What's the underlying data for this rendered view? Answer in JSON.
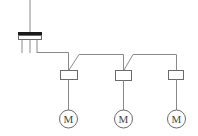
{
  "diagram": {
    "title": "",
    "colors": {
      "background": "#ffffff",
      "wire": "#8a8a8a",
      "outline": "#6a6a6a",
      "busbar": "#1a1a1a",
      "text": "#444444"
    },
    "supply": {
      "label": "power-supply-switch",
      "feed_x": 30,
      "bar": {
        "x": 18,
        "y": 32,
        "width": 24,
        "black_height": 3,
        "white_height": 4
      },
      "legs_x": [
        22,
        30,
        37
      ],
      "legs_bottom_y": 53
    },
    "branches": [
      {
        "id": "branch-1",
        "contactor": {
          "x": 60,
          "y": 70,
          "width": 17,
          "height": 9
        },
        "center_x": 68,
        "motor": {
          "cx": 68,
          "cy": 119,
          "r": 9,
          "label": "M"
        }
      },
      {
        "id": "branch-2",
        "contactor": {
          "x": 115,
          "y": 70,
          "width": 16,
          "height": 10
        },
        "center_x": 123,
        "motor": {
          "cx": 123,
          "cy": 119,
          "r": 9,
          "label": "M"
        }
      },
      {
        "id": "branch-3",
        "contactor": {
          "x": 168,
          "y": 70,
          "width": 15,
          "height": 9
        },
        "center_x": 176,
        "motor": {
          "cx": 176,
          "cy": 119,
          "r": 9,
          "label": "M"
        }
      }
    ],
    "motor_labels": [
      "M",
      "M",
      "M"
    ]
  }
}
